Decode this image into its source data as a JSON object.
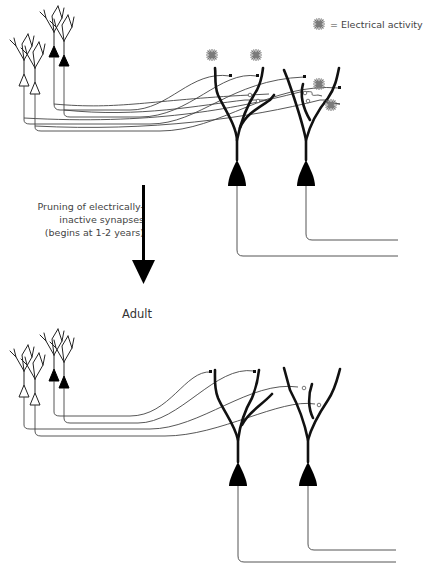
{
  "legend": {
    "icon": "star-burst-icon",
    "label": "= Electrical activity",
    "icon_color": "#7a7a7a"
  },
  "transition": {
    "caption_lines": [
      "Pruning of electrically-",
      "inactive synapses",
      "(begins at 1-2 years)"
    ],
    "arrow": "down-arrow-icon"
  },
  "panels": [
    {
      "name": "infant",
      "label": "",
      "presynaptic_neurons": 4,
      "postsynaptic_neurons": 2,
      "active_synapses": 4,
      "inactive_synapses": 4
    },
    {
      "name": "adult",
      "label": "Adult",
      "presynaptic_neurons": 4,
      "postsynaptic_neurons": 2,
      "active_synapses": 4,
      "inactive_synapses": 0
    }
  ],
  "colors": {
    "neuron_fill_active": "#000000",
    "neuron_fill_inactive": "#ffffff",
    "axon": "#444444",
    "spark": "#7a7a7a"
  }
}
